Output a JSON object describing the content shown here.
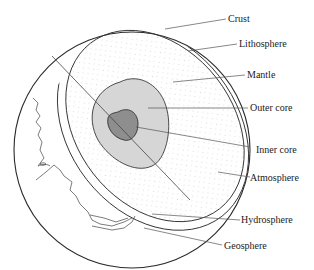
{
  "diagram": {
    "colors": {
      "outline": "#333333",
      "leader": "#555555",
      "mantle_dots": "#b8b8b8",
      "outer_core": "#d4d4d4",
      "inner_core": "#8c8c8c",
      "background": "#ffffff"
    },
    "labels": [
      {
        "id": "crust",
        "text": "Crust"
      },
      {
        "id": "lithosphere",
        "text": "Lithosphere"
      },
      {
        "id": "mantle",
        "text": "Mantle"
      },
      {
        "id": "outer_core",
        "text": "Outer core"
      },
      {
        "id": "inner_core",
        "text": "Inner core"
      },
      {
        "id": "atmosphere",
        "text": "Atmosphere"
      },
      {
        "id": "hydrosphere",
        "text": "Hydrosphere"
      },
      {
        "id": "geosphere",
        "text": "Geosphere"
      }
    ]
  }
}
